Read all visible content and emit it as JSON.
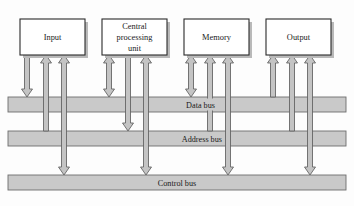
{
  "diagram": {
    "components": [
      {
        "id": "input",
        "label": "Input",
        "lines": [
          "Input"
        ],
        "x": 20,
        "y": 19,
        "w": 65,
        "h": 36
      },
      {
        "id": "cpu",
        "label": "Central processing unit",
        "lines": [
          "Central",
          "processing",
          "unit"
        ],
        "x": 102,
        "y": 19,
        "w": 65,
        "h": 36
      },
      {
        "id": "memory",
        "label": "Memory",
        "lines": [
          "Memory"
        ],
        "x": 184,
        "y": 19,
        "w": 65,
        "h": 36
      },
      {
        "id": "output",
        "label": "Output",
        "lines": [
          "Output"
        ],
        "x": 266,
        "y": 19,
        "w": 65,
        "h": 36
      }
    ],
    "buses": [
      {
        "id": "data",
        "label": "Data bus",
        "y": 97,
        "h": 15,
        "label_x": 215,
        "label_anchor": "end"
      },
      {
        "id": "address",
        "label": "Address bus",
        "y": 131,
        "h": 15,
        "label_x": 222,
        "label_anchor": "end"
      },
      {
        "id": "control",
        "label": "Control bus",
        "y": 175,
        "h": 15,
        "label_x": 177,
        "label_anchor": "middle"
      }
    ],
    "connections": [
      {
        "from": "input",
        "to": "data",
        "direction": "down",
        "x": 27
      },
      {
        "from": "input",
        "to": "address",
        "direction": "up",
        "x": 46
      },
      {
        "from": "input",
        "to": "control",
        "direction": "bidirectional",
        "x": 64
      },
      {
        "from": "cpu",
        "to": "data",
        "direction": "bidirectional",
        "x": 109
      },
      {
        "from": "cpu",
        "to": "address",
        "direction": "down",
        "x": 128
      },
      {
        "from": "cpu",
        "to": "control",
        "direction": "bidirectional",
        "x": 146
      },
      {
        "from": "memory",
        "to": "data",
        "direction": "bidirectional",
        "x": 191
      },
      {
        "from": "memory",
        "to": "address",
        "direction": "up",
        "x": 210
      },
      {
        "from": "memory",
        "to": "control",
        "direction": "bidirectional",
        "x": 228
      },
      {
        "from": "output",
        "to": "data",
        "direction": "up",
        "x": 273
      },
      {
        "from": "output",
        "to": "address",
        "direction": "up",
        "x": 292
      },
      {
        "from": "output",
        "to": "control",
        "direction": "bidirectional",
        "x": 310
      }
    ],
    "colors": {
      "bus_fill": "#c9c9c9",
      "bus_stroke": "#6e6e6e",
      "arrow_fill": "#c4c4c4",
      "arrow_stroke": "#5e5e5e",
      "box_fill": "#ffffff",
      "box_stroke": "#2b2b2b",
      "shadow": "#b9b9b9",
      "text": "#1a1a1a",
      "background": "#fdfdfd"
    }
  }
}
